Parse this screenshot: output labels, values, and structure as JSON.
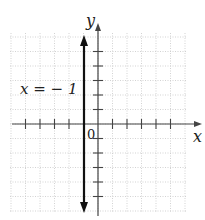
{
  "figure": {
    "type": "coordinate-plane",
    "x_axis_label": "x",
    "y_axis_label": "y",
    "origin_label": "0",
    "equation_label": "x = − 1",
    "line": {
      "equation": "x = -1",
      "x": -1,
      "orientation": "vertical",
      "arrows": "both"
    },
    "grid": {
      "x_range": [
        -6,
        6
      ],
      "y_range": [
        -6,
        6
      ],
      "style": "dotted",
      "color": "#bdbdbd"
    },
    "ticks": {
      "x": [
        -5,
        -4,
        -3,
        -2,
        1,
        2,
        3,
        4,
        5
      ],
      "y": [
        -5,
        -4,
        -3,
        -2,
        -1,
        1,
        2,
        3,
        4,
        5
      ]
    },
    "colors": {
      "axis": "#444444",
      "line": "#111111",
      "grid": "#c8c8c8"
    }
  }
}
